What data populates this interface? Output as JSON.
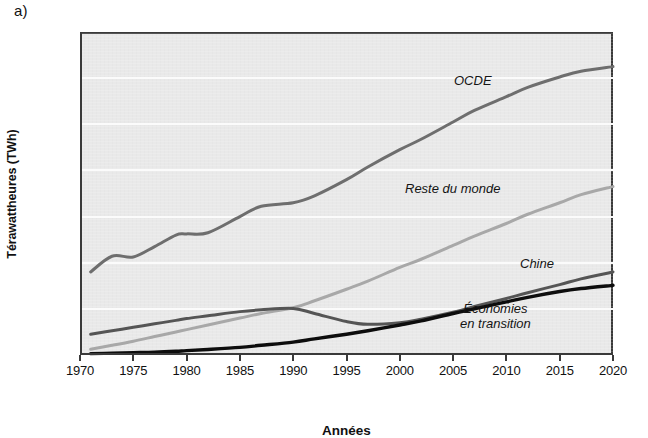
{
  "figure": {
    "panel_label": "a)",
    "y_axis_title": "Térawattheures (TWh)",
    "x_axis_title": "Années"
  },
  "annotations": {
    "ocde": "OCDE",
    "reste_du_monde": "Reste du monde",
    "chine": "Chine",
    "economies_line1": "Économies",
    "economies_line2": "en transition"
  },
  "colors": {
    "plot_background": "#e9e9e9",
    "gridline": "#fbfbfb",
    "axis": "#3a3a3a",
    "ocde": "#6e6e6e",
    "reste_du_monde": "#a8a8a8",
    "chine": "#555555",
    "economies_en_transition": "#0d0d0d"
  },
  "chart_data": {
    "type": "line",
    "title": "",
    "xlabel": "Années",
    "ylabel": "Térawattheures (TWh)",
    "xlim": [
      1970,
      2020
    ],
    "ylim": [
      0,
      14000
    ],
    "xticks": [
      1970,
      1975,
      1980,
      1985,
      1990,
      1995,
      2000,
      2005,
      2010,
      2015,
      2020
    ],
    "yticks": [
      0,
      2000,
      4000,
      6000,
      8000,
      10000,
      12000,
      14000
    ],
    "ytick_labels": [
      "0",
      "2 000",
      "4 000",
      "6 000",
      "8 000",
      "10 000",
      "12 000",
      "14 000"
    ],
    "xtick_labels": [
      "1970",
      "1975",
      "1980",
      "1985",
      "1990",
      "1995",
      "2000",
      "2005",
      "2010",
      "2015",
      "2020"
    ],
    "grid": "horizontal",
    "legend": "inline-annotations",
    "x": [
      1971,
      1973,
      1975,
      1977,
      1979,
      1980,
      1982,
      1985,
      1987,
      1990,
      1992,
      1995,
      1997,
      2000,
      2002,
      2005,
      2007,
      2010,
      2012,
      2015,
      2017,
      2020
    ],
    "series": [
      {
        "name": "OCDE",
        "color": "#6e6e6e",
        "values": [
          3600,
          4280,
          4250,
          4700,
          5200,
          5250,
          5300,
          6000,
          6450,
          6600,
          6900,
          7600,
          8150,
          8900,
          9350,
          10100,
          10600,
          11200,
          11600,
          12050,
          12300,
          12500
        ]
      },
      {
        "name": "Reste du monde",
        "color": "#a8a8a8",
        "values": [
          250,
          420,
          600,
          800,
          1000,
          1100,
          1300,
          1600,
          1800,
          2050,
          2350,
          2850,
          3200,
          3800,
          4150,
          4750,
          5150,
          5700,
          6100,
          6600,
          6950,
          7300
        ]
      },
      {
        "name": "Chine",
        "color": "#555555",
        "values": [
          900,
          1050,
          1200,
          1350,
          1500,
          1580,
          1700,
          1880,
          1960,
          2020,
          1800,
          1450,
          1330,
          1400,
          1550,
          1850,
          2100,
          2450,
          2700,
          3050,
          3300,
          3600
        ]
      },
      {
        "name": "Économies en transition",
        "color": "#0d0d0d",
        "values": [
          60,
          80,
          100,
          120,
          160,
          190,
          240,
          330,
          420,
          560,
          700,
          900,
          1050,
          1300,
          1480,
          1800,
          2000,
          2300,
          2500,
          2750,
          2880,
          3020
        ]
      }
    ]
  }
}
